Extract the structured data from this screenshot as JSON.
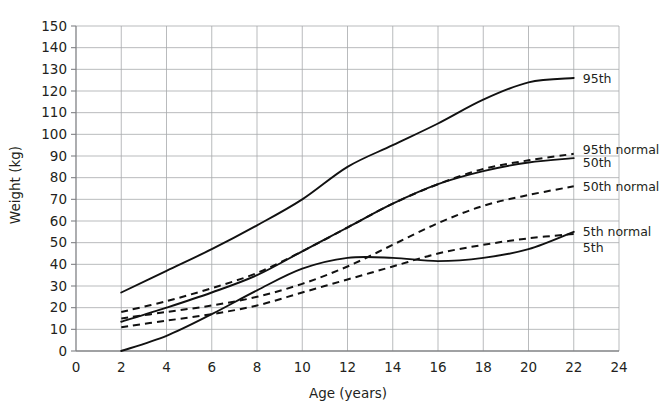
{
  "chart_data": {
    "type": "line",
    "title": "",
    "xlabel": "Age (years)",
    "ylabel": "Weight (kg)",
    "xlim": [
      0,
      24
    ],
    "ylim": [
      0,
      150
    ],
    "xticks": [
      0,
      2,
      4,
      6,
      8,
      10,
      12,
      14,
      16,
      18,
      20,
      22,
      24
    ],
    "yticks": [
      0,
      10,
      20,
      30,
      40,
      50,
      60,
      70,
      80,
      90,
      100,
      110,
      120,
      130,
      140,
      150
    ],
    "grid": true,
    "legend_position": "right-inline-labels",
    "x": [
      2,
      4,
      6,
      8,
      10,
      12,
      14,
      16,
      18,
      20,
      22
    ],
    "series": [
      {
        "name": "95th",
        "label": "95th",
        "style": "solid",
        "color": "#111111",
        "values": [
          27,
          37,
          47,
          58,
          70,
          85,
          95,
          105,
          116,
          124,
          126
        ]
      },
      {
        "name": "95th normal",
        "label": "95th normal",
        "style": "dashed",
        "color": "#111111",
        "values": [
          18,
          23,
          29,
          36,
          46,
          57,
          68,
          77,
          84,
          88,
          91
        ]
      },
      {
        "name": "50th",
        "label": "50th",
        "style": "solid",
        "color": "#111111",
        "values": [
          13.5,
          20,
          27,
          35,
          46,
          57,
          68,
          77,
          83,
          87,
          89
        ]
      },
      {
        "name": "50th normal",
        "label": "50th normal",
        "style": "dashed",
        "color": "#111111",
        "values": [
          15,
          18,
          21,
          25,
          31,
          39,
          49,
          59,
          67,
          72,
          76
        ]
      },
      {
        "name": "5th normal",
        "label": "5th normal",
        "style": "dashed",
        "color": "#111111",
        "values": [
          11,
          14,
          17,
          21,
          27,
          33,
          39,
          45,
          49,
          52,
          54
        ]
      },
      {
        "name": "5th",
        "label": "5th",
        "style": "solid",
        "color": "#111111",
        "values": [
          0,
          7,
          17,
          28,
          38,
          43,
          43,
          41.5,
          43,
          47,
          55
        ]
      }
    ],
    "annotations": [
      {
        "text": "95th",
        "x": 22.4,
        "y": 126
      },
      {
        "text": "95th normal",
        "x": 22.4,
        "y": 93
      },
      {
        "text": "50th",
        "x": 22.4,
        "y": 87
      },
      {
        "text": "50th normal",
        "x": 22.4,
        "y": 76
      },
      {
        "text": "5th normal",
        "x": 22.4,
        "y": 55
      },
      {
        "text": "5th",
        "x": 22.4,
        "y": 48
      }
    ]
  }
}
